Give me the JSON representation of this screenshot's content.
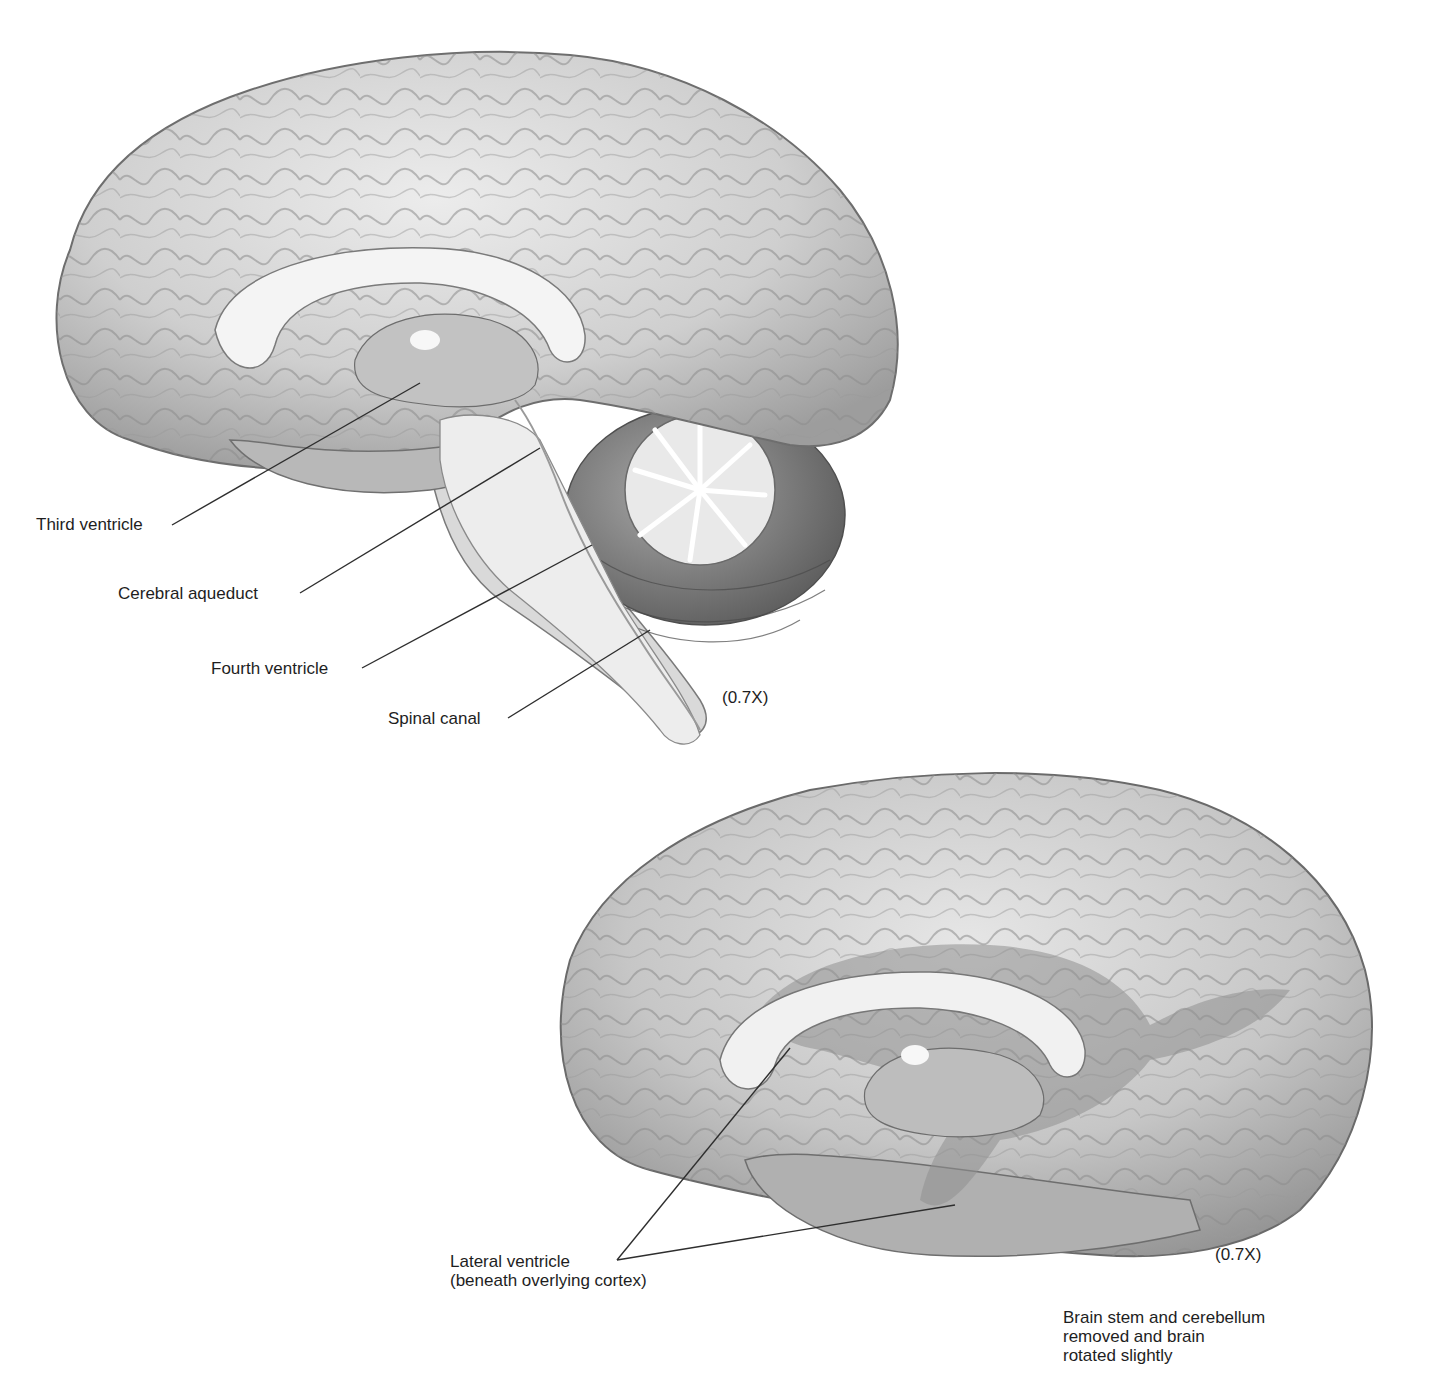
{
  "figure_top": {
    "title": "Sagittal section of brain showing ventricles",
    "labels": {
      "third_ventricle": "Third ventricle",
      "cerebral_aqueduct": "Cerebral aqueduct",
      "fourth_ventricle": "Fourth ventricle",
      "spinal_canal": "Spinal canal"
    },
    "magnification": "(0.7X)",
    "colors": {
      "cortex": "#c9c9c9",
      "ventricle": "#f2f2f2",
      "cerebellum": "#8a8a8a",
      "line": "#333333"
    }
  },
  "figure_bottom": {
    "title": "Medial view, brain stem and cerebellum removed",
    "labels": {
      "lateral_ventricle_line1": "Lateral ventricle",
      "lateral_ventricle_line2": "(beneath overlying cortex)"
    },
    "magnification": "(0.7X)",
    "caption": {
      "line1": "Brain stem and cerebellum",
      "line2": "removed and brain",
      "line3": "rotated slightly"
    },
    "colors": {
      "cortex": "#c4c4c4",
      "ventricle_overlay": "#9a9a9a"
    }
  }
}
